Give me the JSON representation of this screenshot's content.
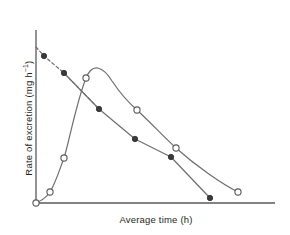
{
  "chart_data": {
    "type": "line",
    "title": "",
    "xlabel_text": "Average time",
    "xlabel_units": "(h)",
    "xlabel": "Average time (h)",
    "ylabel_text": "Rate of excretion",
    "ylabel_units_base": "(mg h",
    "ylabel_units_exp": "−1",
    "ylabel_units_close": ")",
    "ylabel": "Rate of excretion (mg h−1)",
    "grid": false,
    "legend": "none",
    "xlim": [
      0,
      100
    ],
    "ylim": [
      0,
      100
    ],
    "axis_ticks": "none",
    "axis_tick_labels": "none",
    "colors": {
      "axis": "#5a5a5a",
      "line": "#6e6e6e",
      "open_marker_fill": "#ffffff",
      "open_marker_stroke": "#5a5a5a",
      "closed_marker_fill": "#3a3a3a",
      "closed_marker_stroke": "#2b2b2b",
      "text": "#231f20"
    },
    "series": [
      {
        "name": "excretion-rate-curve",
        "marker": "open-circle",
        "line_style": "solid",
        "smoothing": "spline",
        "x": [
          0,
          5.9,
          11.8,
          21.0,
          42.5,
          58.9,
          84.9
        ],
        "y": [
          0.0,
          6.4,
          26.0,
          72.3,
          72.3,
          32.0,
          6.4
        ],
        "points_px": [
          [
            36,
            203
          ],
          [
            50,
            192
          ],
          [
            64,
            158
          ],
          [
            86,
            78
          ],
          [
            137,
            110
          ],
          [
            176,
            148
          ],
          [
            238,
            192
          ]
        ]
      },
      {
        "name": "excretion-rate-semilog-terminal",
        "marker": "closed-circle",
        "line_style": "solid",
        "extrapolation_style": "dashed",
        "x": [
          3.4,
          11.8,
          26.4,
          41.5,
          56.6,
          73.0
        ],
        "y": [
          89.8,
          79.0,
          54.3,
          36.4,
          25.6,
          2.3
        ],
        "points_px": [
          [
            44,
            56
          ],
          [
            64,
            73
          ],
          [
            99,
            109
          ],
          [
            135,
            139
          ],
          [
            171,
            157
          ],
          [
            210,
            198
          ]
        ],
        "extrapolated_origin_px": [
          36,
          47
        ]
      }
    ]
  }
}
